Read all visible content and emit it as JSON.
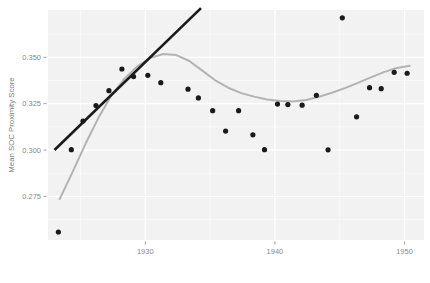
{
  "chart_data": {
    "type": "scatter",
    "title": "",
    "subtitle": "",
    "xlabel": "",
    "ylabel": "Mean SOC Proximity Score",
    "xlim": [
      1922.5,
      1951.5
    ],
    "ylim": [
      0.2515,
      0.3755
    ],
    "xticks": [
      1930,
      1940,
      1950
    ],
    "xticklabels": [
      "1930",
      "1940",
      "1950"
    ],
    "yticks": [
      0.275,
      0.3,
      0.325,
      0.35
    ],
    "yticklabels": [
      "0.275",
      "0.300",
      "0.325",
      "0.350"
    ],
    "grid": true,
    "grid_major_color": "#ffffff",
    "panel_background": "#f2f2f2",
    "legend": "none",
    "point_color": "#1a1a1a",
    "point_radius": 2.6,
    "series": [
      {
        "name": "Mean SOC Proximity Score",
        "type": "scatter",
        "x": [
          1923.3,
          1924.3,
          1925.2,
          1926.2,
          1927.2,
          1928.2,
          1929.1,
          1930.2,
          1931.2,
          1933.3,
          1934.1,
          1935.2,
          1936.2,
          1937.2,
          1938.3,
          1939.2,
          1940.2,
          1941.0,
          1942.1,
          1943.2,
          1944.1,
          1945.2,
          1946.3,
          1947.3,
          1948.2,
          1949.2,
          1950.2
        ],
        "y": [
          0.2558,
          0.3002,
          0.3156,
          0.324,
          0.332,
          0.3437,
          0.3396,
          0.3403,
          0.3363,
          0.3328,
          0.3281,
          0.3212,
          0.3102,
          0.3212,
          0.3082,
          0.3002,
          0.3248,
          0.3245,
          0.3242,
          0.3295,
          0.3001,
          0.3713,
          0.3179,
          0.3336,
          0.3331,
          0.3419,
          0.3414
        ]
      },
      {
        "name": "loess-smooth",
        "type": "line",
        "color": "#b3b3b3",
        "x": [
          1923.4,
          1924.4,
          1925.4,
          1926.4,
          1927.4,
          1928.4,
          1929.4,
          1930.4,
          1931.4,
          1932.4,
          1933.4,
          1934.4,
          1935.4,
          1936.4,
          1937.4,
          1938.4,
          1939.4,
          1940.4,
          1941.4,
          1942.4,
          1943.4,
          1944.4,
          1945.4,
          1946.4,
          1947.4,
          1948.4,
          1949.4,
          1950.4
        ],
        "y": [
          0.2735,
          0.2882,
          0.3035,
          0.3175,
          0.3295,
          0.3385,
          0.3452,
          0.3497,
          0.3518,
          0.3512,
          0.348,
          0.3428,
          0.3376,
          0.3336,
          0.3307,
          0.3288,
          0.3273,
          0.3264,
          0.3262,
          0.327,
          0.3287,
          0.3309,
          0.3334,
          0.3362,
          0.3392,
          0.342,
          0.3442,
          0.3455
        ]
      },
      {
        "name": "linear-trend",
        "type": "line",
        "color": "#1a1a1a",
        "x": [
          1923.0,
          1934.3
        ],
        "y": [
          0.3,
          0.3765
        ]
      }
    ]
  }
}
